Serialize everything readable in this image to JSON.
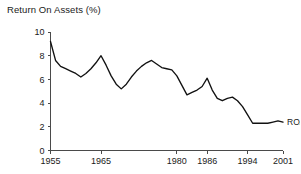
{
  "chart_data": {
    "type": "line",
    "title": "Return On Assets (%)",
    "xlabel": "",
    "ylabel": "",
    "xlim": [
      1955,
      2001
    ],
    "ylim": [
      0,
      10
    ],
    "grid": false,
    "legend_position": "right-inline",
    "y_ticks": [
      0,
      2,
      4,
      6,
      8,
      10
    ],
    "y_tick_labels": [
      "0",
      "2",
      "4",
      "6",
      "8",
      "10"
    ],
    "x_ticks": [
      1955,
      1965,
      1980,
      1986,
      1994,
      2001
    ],
    "x_tick_labels": [
      "1955",
      "1965",
      "1980",
      "1986",
      "1994",
      "2001"
    ],
    "series": [
      {
        "name": "ROA",
        "label": "ROA",
        "color": "#111111",
        "x": [
          1955,
          1956,
          1957,
          1958,
          1959,
          1960,
          1961,
          1962,
          1963,
          1964,
          1965,
          1966,
          1967,
          1968,
          1969,
          1970,
          1971,
          1972,
          1973,
          1974,
          1975,
          1976,
          1977,
          1978,
          1979,
          1980,
          1981,
          1982,
          1983,
          1984,
          1985,
          1986,
          1987,
          1988,
          1989,
          1990,
          1991,
          1992,
          1993,
          1994,
          1995,
          1996,
          1997,
          1998,
          1999,
          2000,
          2001
        ],
        "values": [
          9.2,
          7.6,
          7.1,
          6.9,
          6.7,
          6.5,
          6.2,
          6.5,
          6.9,
          7.4,
          8.0,
          7.2,
          6.3,
          5.6,
          5.2,
          5.6,
          6.2,
          6.7,
          7.1,
          7.4,
          7.6,
          7.3,
          7.0,
          6.9,
          6.8,
          6.3,
          5.5,
          4.7,
          4.9,
          5.1,
          5.4,
          6.1,
          5.1,
          4.4,
          4.2,
          4.4,
          4.5,
          4.2,
          3.7,
          3.0,
          2.3,
          2.3,
          2.3,
          2.3,
          2.4,
          2.5,
          2.4
        ]
      }
    ]
  }
}
